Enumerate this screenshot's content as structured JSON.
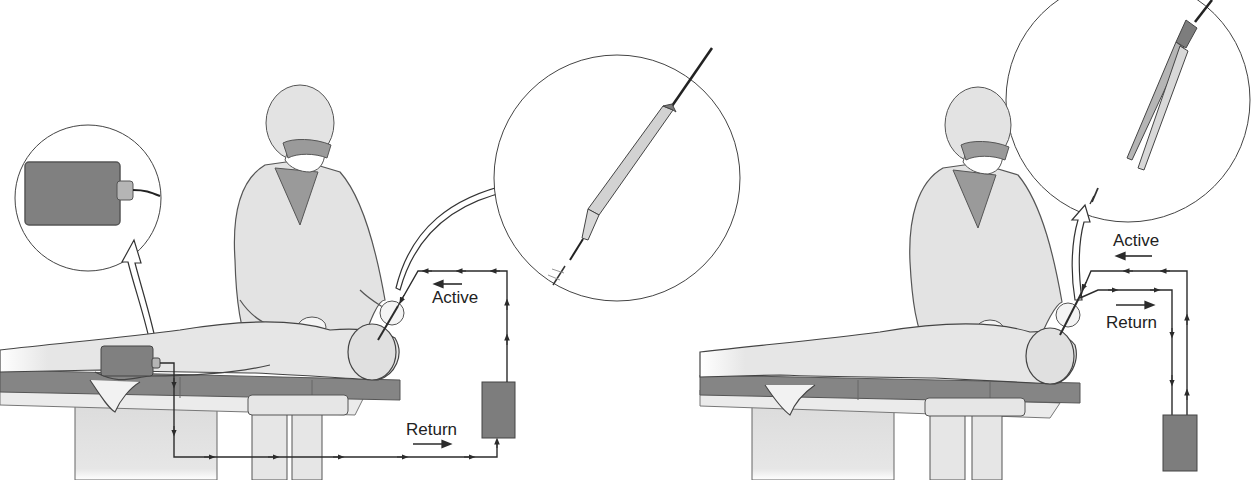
{
  "figure": {
    "panels": [
      {
        "id": "monopolar",
        "instrument": "monopolar-pencil-electrode",
        "labels": {
          "active": "Active",
          "return": "Return"
        },
        "components": [
          "surgeon",
          "patient",
          "operating-table",
          "dispersive-return-pad",
          "generator",
          "active-electrode-inset",
          "return-pad-inset"
        ]
      },
      {
        "id": "bipolar",
        "instrument": "bipolar-forceps",
        "labels": {
          "active": "Active",
          "return": "Return"
        },
        "components": [
          "surgeon",
          "patient",
          "operating-table",
          "generator",
          "bipolar-forceps-inset"
        ]
      }
    ],
    "colors": {
      "line": "#2b2b2b",
      "fill_light": "#e6e6e6",
      "fill_mid": "#b9b9b9",
      "fill_dark": "#7d7d7d",
      "background": "#ffffff"
    }
  }
}
